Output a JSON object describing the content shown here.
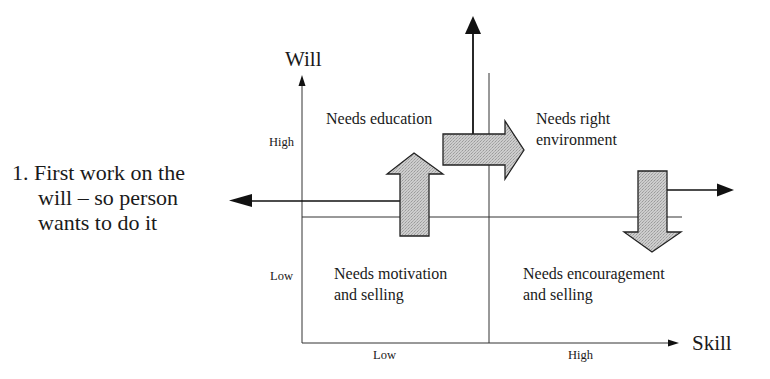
{
  "diagram": {
    "type": "skill-will-matrix",
    "colors": {
      "line": "#1a1a1a",
      "arrow_fill": "#c8c8c8",
      "background": "#ffffff"
    },
    "axes": {
      "y_label": "Will",
      "x_label": "Skill",
      "y_ticks": [
        "High",
        "Low"
      ],
      "x_ticks": [
        "Low",
        "High"
      ]
    },
    "quadrants": {
      "top_left": "Needs education",
      "top_right": [
        "Needs right",
        "environment"
      ],
      "bottom_left": [
        "Needs motivation",
        "and selling"
      ],
      "bottom_right": [
        "Needs encouragement",
        "and selling"
      ]
    },
    "note": {
      "lines": [
        "1. First work on the",
        "will – so person",
        "wants to do it"
      ]
    },
    "arrows": [
      {
        "name": "up-arrow",
        "direction": "up"
      },
      {
        "name": "right-arrow",
        "direction": "right"
      },
      {
        "name": "down-arrow",
        "direction": "down"
      },
      {
        "name": "left-pointer",
        "direction": "left"
      },
      {
        "name": "top-pointer",
        "direction": "up"
      },
      {
        "name": "right-pointer",
        "direction": "right"
      }
    ]
  }
}
